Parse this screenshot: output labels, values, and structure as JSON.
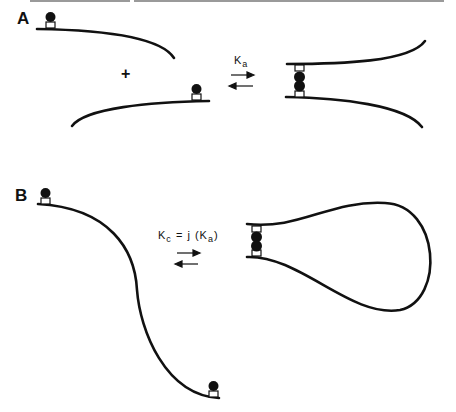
{
  "figure": {
    "panels": [
      {
        "label": "A",
        "equilibrium": {
          "symbol": "K",
          "subscript": "a"
        },
        "operator": "+"
      },
      {
        "label": "B",
        "equilibrium": {
          "lhs_symbol": "K",
          "lhs_subscript": "c",
          "equals": "=",
          "factor": "j",
          "rhs_symbol": "K",
          "rhs_subscript": "a"
        }
      }
    ],
    "colors": {
      "line": "#111111",
      "background": "#ffffff",
      "border": "#9a9a9a"
    }
  }
}
